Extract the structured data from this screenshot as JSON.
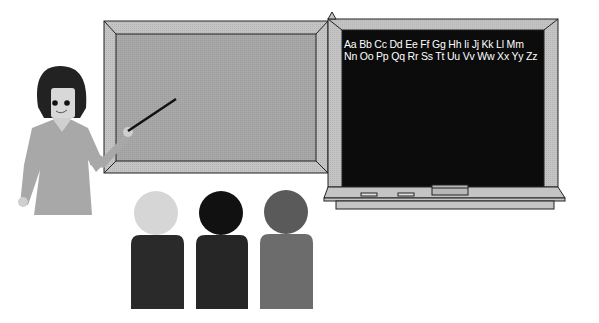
{
  "scene": {
    "description": "Classroom clip-art: teacher pointing at a board, chalkboard with alphabet, three students",
    "colors": {
      "frame": "#c4c4c4",
      "whiteboard": "#a8a8a8",
      "chalkboard": "#0c0c0c",
      "teacher_dress": "#a8a8a8",
      "teacher_hair": "#222222",
      "student_1_head": "#d6d6d6",
      "student_1_body": "#2a2a2a",
      "student_2_head": "#111111",
      "student_2_body": "#262626",
      "student_3_head": "#5a5a5a",
      "student_3_body": "#6c6c6c"
    }
  },
  "chalkboard": {
    "line1": "Aa Bb Cc Dd Ee Ff Gg Hh Ii Jj Kk Ll Mm",
    "line2": "Nn Oo Pp Qq Rr Ss Tt Uu Vv Ww Xx Yy Zz"
  },
  "icons": {
    "teacher": "teacher-figure",
    "pointer": "pointer-stick",
    "eraser": "eraser",
    "chalk": "chalk-piece"
  }
}
